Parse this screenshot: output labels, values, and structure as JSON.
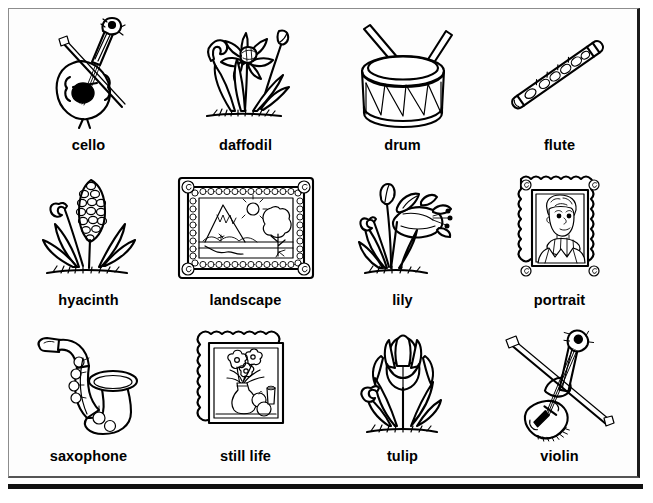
{
  "page": {
    "ink_color": "#000000",
    "paper_color": "#ffffff",
    "frame_color": "#8d8d8d",
    "rule_color": "#111111",
    "columns": 4,
    "rows": 3
  },
  "items": [
    {
      "label": "cello",
      "icon": "cello-illustration",
      "row": 1,
      "col": 1,
      "category": "instrument"
    },
    {
      "label": "daffodil",
      "icon": "daffodil-illustration",
      "row": 1,
      "col": 2,
      "category": "flower"
    },
    {
      "label": "drum",
      "icon": "drum-illustration",
      "row": 1,
      "col": 3,
      "category": "instrument"
    },
    {
      "label": "flute",
      "icon": "flute-illustration",
      "row": 1,
      "col": 4,
      "category": "instrument"
    },
    {
      "label": "hyacinth",
      "icon": "hyacinth-illustration",
      "row": 2,
      "col": 1,
      "category": "flower"
    },
    {
      "label": "landscape",
      "icon": "landscape-illustration",
      "row": 2,
      "col": 2,
      "category": "picture"
    },
    {
      "label": "lily",
      "icon": "lily-illustration",
      "row": 2,
      "col": 3,
      "category": "flower"
    },
    {
      "label": "portrait",
      "icon": "portrait-illustration",
      "row": 2,
      "col": 4,
      "category": "picture"
    },
    {
      "label": "saxophone",
      "icon": "saxophone-illustration",
      "row": 3,
      "col": 1,
      "category": "instrument"
    },
    {
      "label": "still life",
      "icon": "still-life-illustration",
      "row": 3,
      "col": 2,
      "category": "picture"
    },
    {
      "label": "tulip",
      "icon": "tulip-illustration",
      "row": 3,
      "col": 3,
      "category": "flower"
    },
    {
      "label": "violin",
      "icon": "violin-illustration",
      "row": 3,
      "col": 4,
      "category": "instrument"
    }
  ]
}
